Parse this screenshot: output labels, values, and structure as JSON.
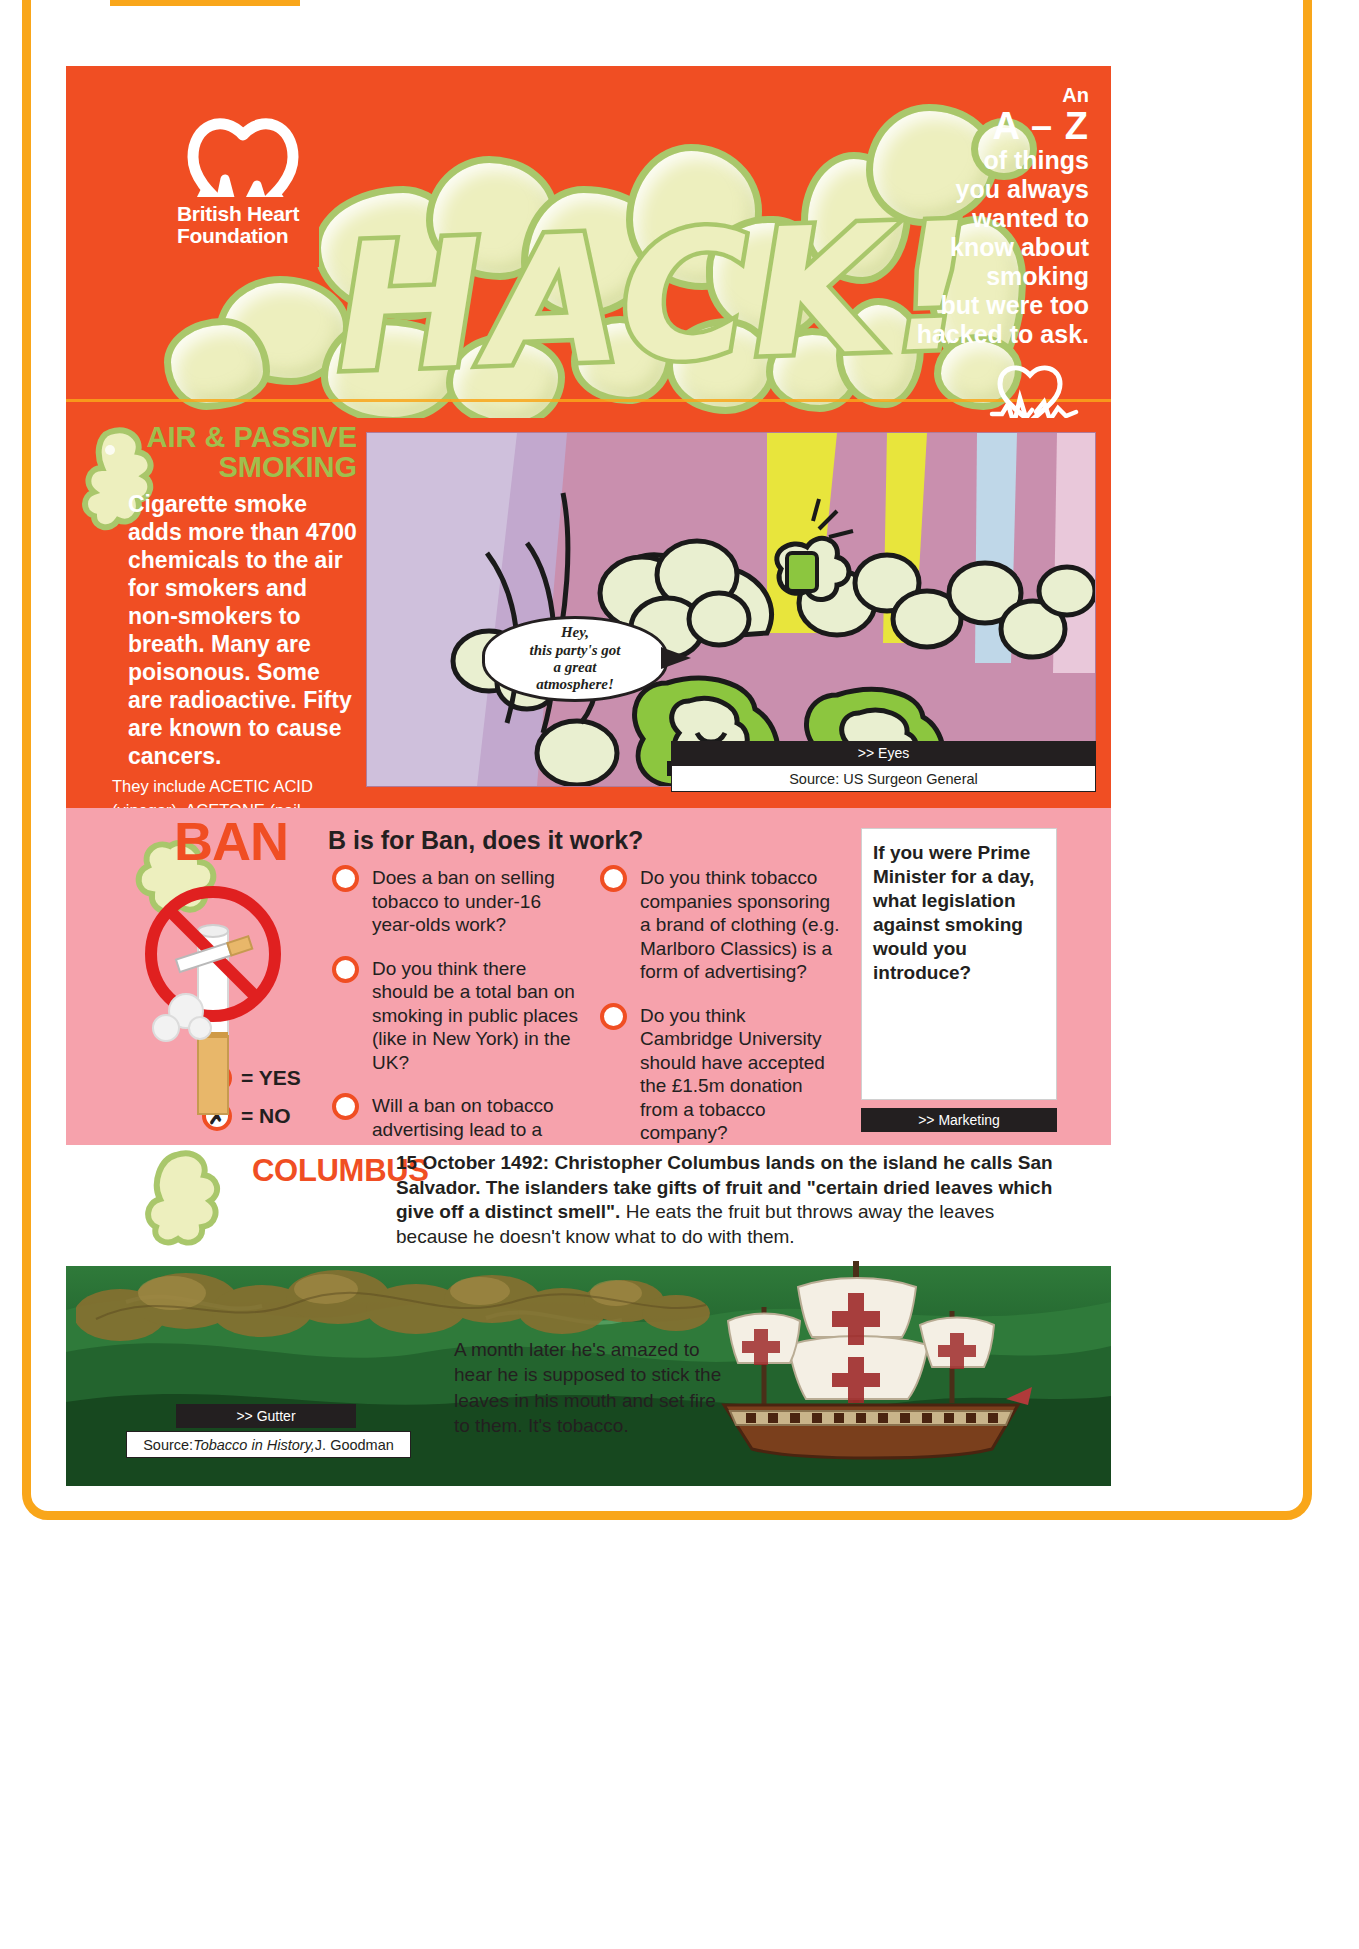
{
  "page": {
    "publisher": "British Heart Foundation",
    "logo_line1": "British Heart",
    "logo_line2": "Foundation",
    "hack_title": "HACK!"
  },
  "header": {
    "az_an": "An",
    "az_letters": "A – Z",
    "az_lines": [
      "of things",
      "you always",
      "wanted to",
      "know about",
      "smoking",
      "but were too",
      "hacked to ask."
    ]
  },
  "air_section": {
    "title_line1": "AIR & PASSIVE",
    "title_line2": "SMOKING",
    "lead": "Cigarette smoke adds more than 4700 chemicals to the air for smokers and non-smokers to breath.  Many are poisonous. Some are radioactive.  Fifty are known to cause cancers.",
    "fine": "They include ACETIC ACID (vinegar), ACETONE (nail varnish remover), AMMONIA (cleaner), and ARSENIC (poison).  And that's just some of the A's...",
    "bubble_line1": "Hey,",
    "bubble_line2": "this party's got",
    "bubble_line3": "a great",
    "bubble_line4": "atmosphere!",
    "cross_ref": ">> Eyes",
    "source": "Source: US Surgeon General"
  },
  "ban_section": {
    "letter_word": "BAN",
    "question_heading": "B is for Ban, does it work?",
    "questions_left": [
      "Does a ban on selling tobacco to under-16 year-olds work?",
      "Do you think there should be a total ban on smoking in public places (like in New York) in the UK?",
      "Will a ban on tobacco advertising lead to a decrease in tobacco consumption?"
    ],
    "questions_right": [
      "Do you think tobacco companies sponsoring a brand of clothing (e.g. Marlboro Classics) is a form of advertising?",
      "Do you think Cambridge University should have accepted the £1.5m donation from a tobacco company?"
    ],
    "legend_yes": "= YES",
    "legend_no": "= NO",
    "legend_yes_icon": "✓",
    "legend_no_icon": "✗",
    "prime_minister_prompt": "If you were Prime Minister for a day, what legislation against smoking would you introduce?",
    "cross_ref": ">> Marketing"
  },
  "columbus_section": {
    "title": "COLUMBUS",
    "body_bold": "15 October 1492: Christopher Columbus lands on the island he calls San Salvador. The islanders take gifts of fruit and \"certain dried leaves which give off a distinct smell\".",
    "body_regular": "  He eats the fruit but throws away the leaves because he doesn't know what to do with them.",
    "body2": "A month later he's amazed to hear he is supposed to stick the leaves in his mouth and set fire to them. It's tobacco.",
    "cross_ref": ">> Gutter",
    "source_prefix": "Source: ",
    "source_italic": "Tobacco in History,",
    "source_suffix": " J. Goodman"
  },
  "colors": {
    "orange": "#F04E23",
    "amber_border": "#F9A61A",
    "smoke_green": "#A9C76B",
    "smoke_fill": "#EDEFBE",
    "pink": "#F6A2AC",
    "mauve": "#C98FAE",
    "black": "#231f20",
    "white": "#FFFFFF"
  }
}
